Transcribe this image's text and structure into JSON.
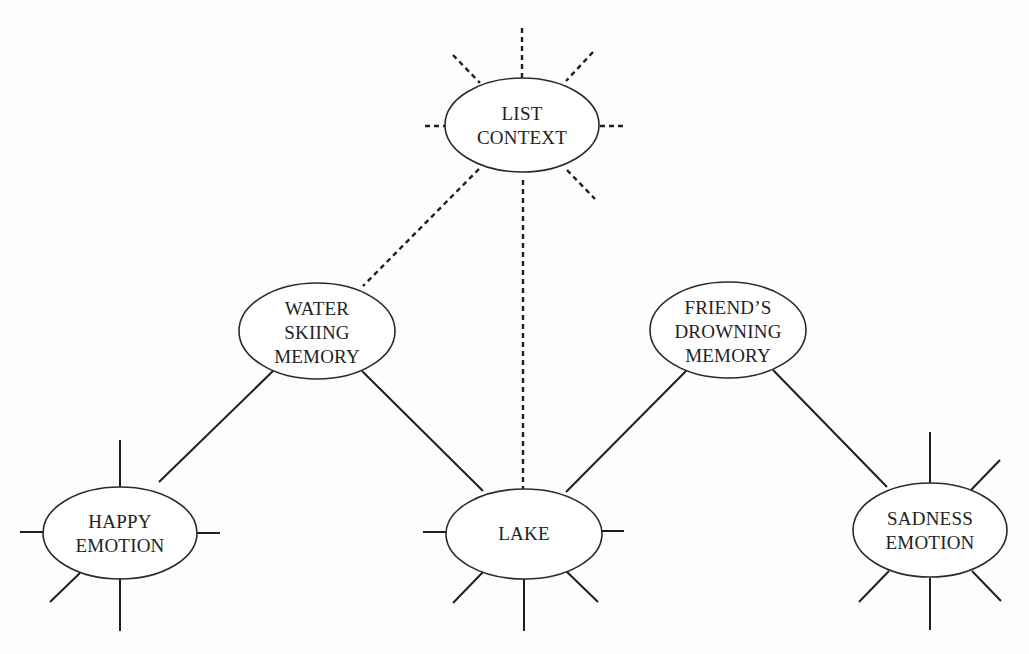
{
  "diagram": {
    "type": "spreading-activation-network",
    "colors": {
      "background": "#fdfdfd",
      "line": "#1e1e1e",
      "node_fill": "#ffffff",
      "node_stroke": "#2a2a2a",
      "text": "#222222"
    },
    "nodes": {
      "list_context": {
        "label_lines": [
          "LIST",
          "CONTEXT"
        ],
        "cx": 522,
        "cy": 125,
        "rx": 77,
        "ry": 47,
        "spoke_style": "dashed"
      },
      "water_skiing_memory": {
        "label_lines": [
          "WATER",
          "SKIING",
          "MEMORY"
        ],
        "cx": 317,
        "cy": 331,
        "rx": 78,
        "ry": 48,
        "spoke_style": "none"
      },
      "friends_drowning_memory": {
        "label_lines": [
          "FRIEND’S",
          "DROWNING",
          "MEMORY"
        ],
        "cx": 728,
        "cy": 330,
        "rx": 78,
        "ry": 48,
        "spoke_style": "none"
      },
      "happy_emotion": {
        "label_lines": [
          "HAPPY",
          "EMOTION"
        ],
        "cx": 120,
        "cy": 533,
        "rx": 77,
        "ry": 46,
        "spoke_style": "solid"
      },
      "lake": {
        "label_lines": [
          "LAKE"
        ],
        "cx": 524,
        "cy": 534,
        "rx": 78,
        "ry": 45,
        "spoke_style": "solid"
      },
      "sadness_emotion": {
        "label_lines": [
          "SADNESS",
          "EMOTION"
        ],
        "cx": 930,
        "cy": 530,
        "rx": 77,
        "ry": 47,
        "spoke_style": "solid"
      }
    },
    "edges": [
      {
        "from": "list_context",
        "to": "water_skiing_memory",
        "style": "dashed"
      },
      {
        "from": "list_context",
        "to": "lake",
        "style": "dashed"
      },
      {
        "from": "water_skiing_memory",
        "to": "happy_emotion",
        "style": "solid"
      },
      {
        "from": "water_skiing_memory",
        "to": "lake",
        "style": "solid"
      },
      {
        "from": "friends_drowning_memory",
        "to": "lake",
        "style": "solid"
      },
      {
        "from": "friends_drowning_memory",
        "to": "sadness_emotion",
        "style": "solid"
      }
    ]
  }
}
